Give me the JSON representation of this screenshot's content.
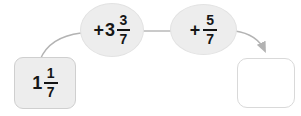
{
  "diagram": {
    "start": {
      "whole": "1",
      "num": "1",
      "den": "7"
    },
    "jumps": [
      {
        "op": "+",
        "whole": "3",
        "num": "3",
        "den": "7"
      },
      {
        "op": "+",
        "whole": "",
        "num": "5",
        "den": "7"
      }
    ],
    "answer": ""
  },
  "colors": {
    "shape_fill": "#ededed",
    "shape_border": "#cfcfcf",
    "answer_fill": "#ffffff",
    "answer_border": "#d9d9d9",
    "connector": "#b3b3b3",
    "text": "#161616"
  }
}
